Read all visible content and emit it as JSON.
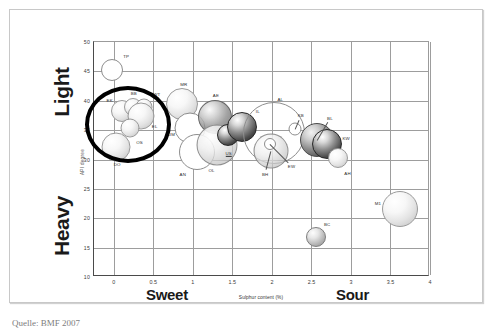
{
  "figure": {
    "source_caption": "Quelle: BMF 2007"
  },
  "chart_data": {
    "type": "scatter",
    "title": "",
    "subtitle": "",
    "xlabel": "Sulphur content (%)",
    "ylabel": "API degree",
    "xlim": [
      -0.25,
      4.0
    ],
    "ylim": [
      10,
      50
    ],
    "xticks": [
      "0",
      "0.5",
      "1",
      "1.5",
      "2",
      "2.5",
      "3",
      "3.5",
      "4"
    ],
    "xtick_values": [
      0,
      0.5,
      1,
      1.5,
      2,
      2.5,
      3,
      3.5,
      4
    ],
    "yticks": [
      "50",
      "45",
      "40",
      "35",
      "30",
      "25",
      "20",
      "15",
      "10"
    ],
    "ytick_values": [
      50,
      45,
      40,
      35,
      30,
      25,
      20,
      15,
      10
    ],
    "grid": true,
    "legend": "none",
    "axis_annotations": {
      "y_top": "Light",
      "y_bottom": "Heavy",
      "x_left": "Sweet",
      "x_right": "Sour"
    },
    "annotations": [
      {
        "name": "sweet-light-highlight-circle",
        "shape": "ellipse",
        "x_center": 0.18,
        "y_center": 37.8,
        "description": "Bold black ring highlighting the sweet / light crude cluster"
      }
    ],
    "points": [
      {
        "label": "TP",
        "x": -0.02,
        "y": 45.2,
        "size": 22,
        "shade": "hollow"
      },
      {
        "label": "EK",
        "x": 0.1,
        "y": 38.3,
        "size": 22,
        "shade": "light"
      },
      {
        "label": "BB",
        "x": 0.24,
        "y": 39.0,
        "size": 18,
        "shade": "light"
      },
      {
        "label": "WT",
        "x": 0.38,
        "y": 38.9,
        "size": 17,
        "shade": "light"
      },
      {
        "label": "EL",
        "x": 0.34,
        "y": 37.4,
        "size": 27,
        "shade": "light"
      },
      {
        "label": "OS",
        "x": 0.2,
        "y": 35.4,
        "size": 19,
        "shade": "light"
      },
      {
        "label": "DO",
        "x": 0.03,
        "y": 32.2,
        "size": 29,
        "shade": "light"
      },
      {
        "label": "MR",
        "x": 0.86,
        "y": 39.5,
        "size": 32,
        "shade": "light"
      },
      {
        "label": "UM",
        "x": 0.97,
        "y": 35.3,
        "size": 31,
        "shade": "hollow"
      },
      {
        "label": "AN",
        "x": 1.05,
        "y": 31.3,
        "size": 36,
        "shade": "hollow"
      },
      {
        "label": "AE",
        "x": 1.28,
        "y": 37.2,
        "size": 34,
        "shade": "transdark"
      },
      {
        "label": "OL",
        "x": 1.3,
        "y": 32.4,
        "size": 41,
        "shade": "trans"
      },
      {
        "label": "US",
        "x": 1.44,
        "y": 34.2,
        "size": 22,
        "shade": "darker"
      },
      {
        "label": "IL",
        "x": 1.62,
        "y": 35.5,
        "size": 30,
        "shade": "darker"
      },
      {
        "label": "AL",
        "x": 2.03,
        "y": 34.5,
        "size": 62,
        "shade": "outline"
      },
      {
        "label": "BH",
        "x": 1.99,
        "y": 31.4,
        "size": 35,
        "shade": "trans"
      },
      {
        "label": "EW",
        "x": 1.97,
        "y": 32.6,
        "size": 12,
        "shade": "hollow"
      },
      {
        "label": "KB",
        "x": 2.29,
        "y": 35.2,
        "size": 13,
        "shade": "hollow"
      },
      {
        "label": "BL",
        "x": 2.57,
        "y": 33.3,
        "size": 34,
        "shade": "dark"
      },
      {
        "label": "KW",
        "x": 2.7,
        "y": 32.6,
        "size": 30,
        "shade": "darker"
      },
      {
        "label": "AH",
        "x": 2.83,
        "y": 30.3,
        "size": 20,
        "shade": "light"
      },
      {
        "label": "BC",
        "x": 2.56,
        "y": 16.8,
        "size": 20,
        "shade": "mid"
      },
      {
        "label": "M1",
        "x": 3.62,
        "y": 21.5,
        "size": 36,
        "shade": "light"
      }
    ]
  }
}
